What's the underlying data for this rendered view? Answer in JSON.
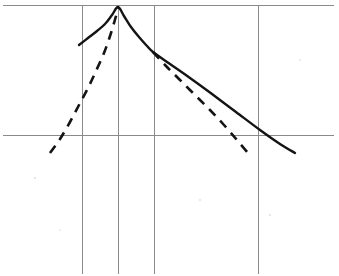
{
  "figure": {
    "kind": "hand-drawn-line-sketch",
    "background_color": "#ffffff",
    "ink_color": "#141414",
    "grid_color": "#8a8a8a",
    "width": 339,
    "height": 276
  },
  "chart_data": {
    "type": "line",
    "title": "",
    "subtitle": "",
    "xlabel": "",
    "ylabel": "",
    "xlim": [
      0,
      339
    ],
    "ylim": [
      276,
      0
    ],
    "grid": true,
    "grid_style": "axis lines plus four vertical reference lines",
    "legend": "none",
    "legend_position": "none",
    "annotations": [],
    "tick_labels": {
      "x": [],
      "y": []
    },
    "axes": [
      {
        "name": "top-horizontal-line",
        "orientation": "horizontal",
        "y": 5,
        "x_start": 3,
        "x_end": 334
      },
      {
        "name": "middle-horizontal-line",
        "orientation": "horizontal",
        "y": 135,
        "x_start": 3,
        "x_end": 334
      }
    ],
    "reference_lines": [
      {
        "name": "vertical-reference-1",
        "x": 82,
        "y_start": 5,
        "y_end": 274
      },
      {
        "name": "vertical-reference-2",
        "x": 118,
        "y_start": 5,
        "y_end": 274
      },
      {
        "name": "vertical-reference-3",
        "x": 154,
        "y_start": 5,
        "y_end": 274
      },
      {
        "name": "vertical-reference-4",
        "x": 258,
        "y_start": 5,
        "y_end": 274
      }
    ],
    "series": [
      {
        "name": "solid-curve",
        "style": "solid",
        "color": "#141414",
        "points": [
          [
            79,
            45
          ],
          [
            88,
            38
          ],
          [
            97,
            31
          ],
          [
            105,
            24
          ],
          [
            112,
            15
          ],
          [
            118,
            7
          ],
          [
            124,
            16
          ],
          [
            131,
            27
          ],
          [
            139,
            37
          ],
          [
            147,
            46
          ],
          [
            153,
            52
          ],
          [
            170,
            64
          ],
          [
            190,
            78
          ],
          [
            212,
            94
          ],
          [
            236,
            112
          ],
          [
            260,
            130
          ],
          [
            280,
            144
          ],
          [
            295,
            153
          ]
        ]
      },
      {
        "name": "dashed-ascending-curve",
        "style": "dashed",
        "color": "#141414",
        "points": [
          [
            50,
            153
          ],
          [
            60,
            139
          ],
          [
            70,
            122
          ],
          [
            79,
            105
          ],
          [
            88,
            88
          ],
          [
            96,
            71
          ],
          [
            104,
            53
          ],
          [
            111,
            33
          ],
          [
            116,
            16
          ],
          [
            118,
            7
          ]
        ]
      },
      {
        "name": "dashed-descending-curve",
        "style": "dashed",
        "color": "#141414",
        "points": [
          [
            153,
            52
          ],
          [
            166,
            66
          ],
          [
            180,
            80
          ],
          [
            195,
            95
          ],
          [
            210,
            110
          ],
          [
            224,
            125
          ],
          [
            237,
            140
          ],
          [
            248,
            153
          ]
        ]
      }
    ],
    "key_points": [
      {
        "name": "peak",
        "x": 118,
        "y": 7
      },
      {
        "name": "kink-node",
        "x": 153,
        "y": 52
      },
      {
        "name": "solid-left-end",
        "x": 79,
        "y": 45
      },
      {
        "name": "solid-right-end",
        "x": 295,
        "y": 153
      },
      {
        "name": "dashed-left-end",
        "x": 50,
        "y": 153
      },
      {
        "name": "dashed-right-end",
        "x": 248,
        "y": 153
      }
    ]
  }
}
